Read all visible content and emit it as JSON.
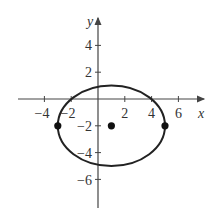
{
  "figure": {
    "x_axis_label": "x",
    "y_axis_label": "y",
    "x_ticks": [
      {
        "value": -4,
        "label": "−4"
      },
      {
        "value": -2,
        "label": "−2"
      },
      {
        "value": 2,
        "label": "2"
      },
      {
        "value": 4,
        "label": "4"
      },
      {
        "value": 6,
        "label": "6"
      }
    ],
    "y_ticks": [
      {
        "value": 4,
        "label": "4"
      },
      {
        "value": 2,
        "label": "2"
      },
      {
        "value": -2,
        "label": "−2"
      },
      {
        "value": -4,
        "label": "−4"
      },
      {
        "value": -6,
        "label": "−6"
      }
    ],
    "ellipse": {
      "center": [
        1,
        -2
      ],
      "semi_x": 4,
      "semi_y": 3
    },
    "points": [
      {
        "name": "center",
        "x": 1,
        "y": -2
      },
      {
        "name": "left-vertex",
        "x": -3,
        "y": -2
      },
      {
        "name": "right-vertex",
        "x": 5,
        "y": -2
      }
    ],
    "colors": {
      "curve": "#222222",
      "axis": "#444444"
    }
  }
}
